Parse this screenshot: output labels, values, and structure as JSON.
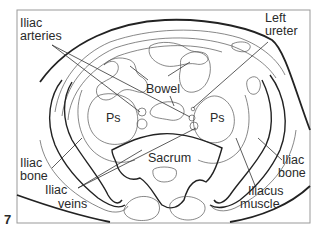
{
  "figure": {
    "number": "7",
    "type": "transverse-section line drawing of the pelvis"
  },
  "labels": {
    "iliac_arteries": [
      "Iliac",
      "arteries"
    ],
    "left_ureter": [
      "Left",
      "ureter"
    ],
    "bowel": "Bowel",
    "psoas_left": "Ps",
    "psoas_right": "Ps",
    "sacrum": "Sacrum",
    "iliac_bone_left": [
      "Iliac",
      "bone"
    ],
    "iliac_bone_right": [
      "Iliac",
      "bone"
    ],
    "iliac_veins": [
      "Iliac",
      "veins"
    ],
    "iliacus_muscle": [
      "Iliacus",
      "muscle"
    ]
  }
}
